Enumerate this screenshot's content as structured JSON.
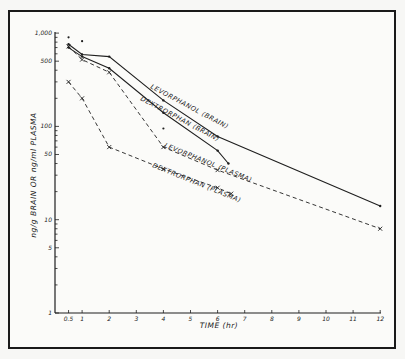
{
  "chart_data": {
    "type": "line",
    "title": "",
    "xlabel": "TIME (hr)",
    "ylabel": "ng/g BRAIN OR ng/ml PLASMA",
    "yscale": "log",
    "xlim": [
      0,
      12
    ],
    "ylim": [
      1,
      1000
    ],
    "x_ticks": [
      "0.5",
      "1",
      "2",
      "3",
      "4",
      "5",
      "6",
      "7",
      "8",
      "9",
      "10",
      "11",
      "12"
    ],
    "y_ticks": [
      "1",
      "5",
      "10",
      "50",
      "100",
      "500",
      "1,000"
    ],
    "grid": false,
    "legend": "inline labels along curves",
    "series": [
      {
        "name": "LEVORPHANOL (BRAIN)",
        "style": "solid",
        "x": [
          0.5,
          1,
          2,
          4,
          6,
          12
        ],
        "values": [
          760,
          590,
          560,
          190,
          78,
          14
        ]
      },
      {
        "name": "DEXTRORPHAN (BRAIN)",
        "style": "solid",
        "x": [
          0.5,
          1,
          2,
          4,
          6,
          6.4
        ],
        "values": [
          700,
          560,
          420,
          140,
          55,
          40
        ]
      },
      {
        "name": "LEVORPHANOL (PLASMA)",
        "style": "dashed",
        "x": [
          0.5,
          1,
          2,
          4,
          6,
          12
        ],
        "values": [
          720,
          520,
          380,
          60,
          34,
          8
        ]
      },
      {
        "name": "DEXTRORPHAN (PLASMA)",
        "style": "dashed",
        "x": [
          0.5,
          1,
          2,
          4,
          6,
          6.5
        ],
        "values": [
          300,
          200,
          60,
          35,
          22,
          19
        ]
      }
    ]
  },
  "labels": {
    "x_axis_title": "TIME (hr)",
    "y_axis_title": "ng/g BRAIN OR ng/ml PLASMA",
    "curve_levorphanol_brain": "LEVORPHANOL (BRAIN)",
    "curve_dextrorphan_brain": "DEXTRORPHAN (BRAIN)",
    "curve_levorphanol_plasma": "LEVORPHANOL (PLASMA)",
    "curve_dextrorphan_plasma": "DEXTRORPHAN (PLASMA)"
  },
  "colors": {
    "ink": "#1f1f1f",
    "paper": "#fbfbf9"
  }
}
